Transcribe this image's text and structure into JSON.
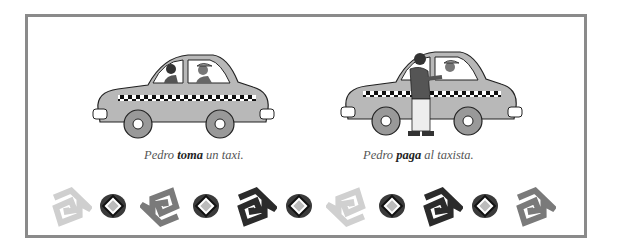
{
  "panels": [
    {
      "id": "toma",
      "illustration": "taxi-with-passenger-and-driver",
      "caption": {
        "subject": "Pedro",
        "verb": "toma",
        "rest": "un taxi."
      }
    },
    {
      "id": "paga",
      "illustration": "man-paying-taxi-driver",
      "caption": {
        "subject": "Pedro",
        "verb": "paga",
        "rest": "al taxista."
      }
    }
  ],
  "decorations": [
    {
      "type": "spiral-square-icon",
      "shade": "#cfcfcf",
      "rotation": -10
    },
    {
      "type": "diamond-badge-icon",
      "shade": "#3a3a3a"
    },
    {
      "type": "spiral-square-icon",
      "shade": "#7a7a7a",
      "rotation": 170
    },
    {
      "type": "diamond-badge-icon",
      "shade": "#3a3a3a"
    },
    {
      "type": "spiral-square-icon",
      "shade": "#2b2b2b",
      "rotation": -10
    },
    {
      "type": "diamond-badge-icon",
      "shade": "#3a3a3a"
    },
    {
      "type": "spiral-square-icon",
      "shade": "#d0d0d0",
      "rotation": 170
    },
    {
      "type": "diamond-badge-icon",
      "shade": "#3a3a3a"
    },
    {
      "type": "spiral-square-icon",
      "shade": "#2b2b2b",
      "rotation": -10
    },
    {
      "type": "diamond-badge-icon",
      "shade": "#3a3a3a"
    },
    {
      "type": "spiral-square-icon",
      "shade": "#7a7a7a",
      "rotation": -10
    }
  ],
  "colors": {
    "frame_border": "#8a8a8a",
    "car_body": "#b8b8b8",
    "caption_text": "#555555",
    "caption_bold": "#222222"
  }
}
